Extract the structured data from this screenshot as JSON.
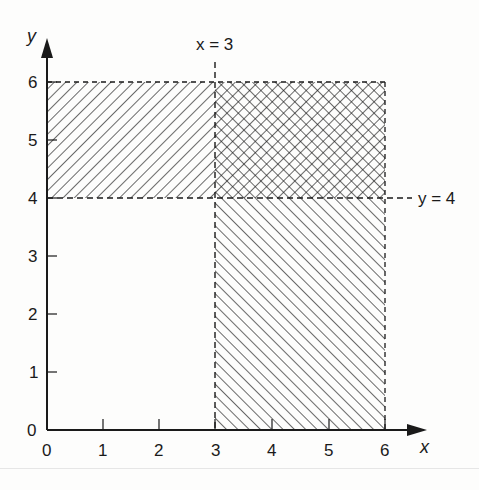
{
  "diagram": {
    "type": "inequality-region-graph",
    "axes": {
      "x_label": "x",
      "y_label": "y",
      "x_ticks": [
        "0",
        "1",
        "2",
        "3",
        "4",
        "5",
        "6"
      ],
      "y_ticks": [
        "0",
        "1",
        "2",
        "3",
        "4",
        "5",
        "6"
      ],
      "x_range": [
        0,
        6
      ],
      "y_range": [
        0,
        6
      ]
    },
    "boundary_lines": [
      {
        "label": "x = 3",
        "orientation": "vertical",
        "value": 3,
        "style": "dashed"
      },
      {
        "label": "y = 4",
        "orientation": "horizontal",
        "value": 4,
        "style": "dashed"
      }
    ],
    "regions": [
      {
        "name": "y > 4 only",
        "x": [
          0,
          3
        ],
        "y": [
          4,
          6
        ],
        "hatch": "forward-diagonal"
      },
      {
        "name": "x > 3 only",
        "x": [
          3,
          6
        ],
        "y": [
          0,
          4
        ],
        "hatch": "backward-diagonal"
      },
      {
        "name": "overlap x > 3 and y > 4",
        "x": [
          3,
          6
        ],
        "y": [
          4,
          6
        ],
        "hatch": "crosshatch"
      }
    ],
    "colors": {
      "ink": "#1a1a1a",
      "background": "#fdfdfc"
    }
  }
}
